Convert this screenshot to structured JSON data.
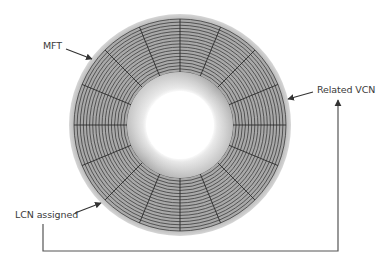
{
  "diagram": {
    "type": "disk-platter",
    "disk": {
      "center": [
        180,
        125
      ],
      "outer_radius": 111,
      "track_outer_radius": 106,
      "track_inner_radius": 53,
      "hub_radius": 53,
      "hole_radius": 34,
      "track_count": 17,
      "sector_count": 16,
      "colors": {
        "rim": "#bdbdbd",
        "track_fill": "#a9a9a9",
        "track_line": "#3c3c3c",
        "radial_line": "#2a2a2a",
        "hub_light": "#f2f2f2",
        "hub_dark": "#9a9a9a"
      }
    },
    "labels": {
      "mft": "MFT",
      "related_vcn": "Related VCN",
      "lcn_assigned": "LCN assigned"
    },
    "connector": {
      "from": "LCN assigned",
      "to": "Related VCN",
      "color": "#555555"
    }
  }
}
